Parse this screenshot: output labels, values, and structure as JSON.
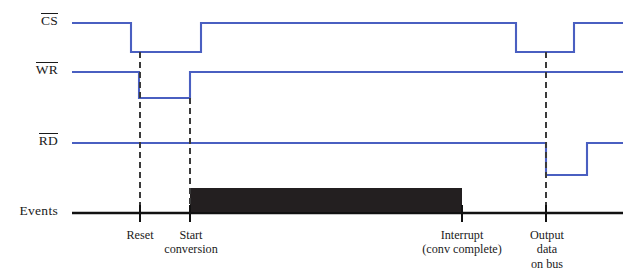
{
  "diagram": {
    "type": "timing-diagram",
    "width": 635,
    "height": 274,
    "colors": {
      "signal": "#4a5fc1",
      "event_line": "#111111",
      "dashed": "#3a3a3a",
      "conversion_bar": "#231f20",
      "background": "#ffffff"
    },
    "signals": [
      {
        "name": "CS",
        "label": "CS",
        "overbar": true,
        "active_low": true,
        "high_y": 23,
        "low_y": 52,
        "label_x": 58,
        "label_y": 23,
        "start_x": 72,
        "end_x": 623,
        "transitions": [
          {
            "x": 131,
            "edge": "falling"
          },
          {
            "x": 201,
            "edge": "rising"
          },
          {
            "x": 516,
            "edge": "falling"
          },
          {
            "x": 574,
            "edge": "rising"
          }
        ]
      },
      {
        "name": "WR",
        "label": "WR",
        "overbar": true,
        "active_low": true,
        "high_y": 72,
        "low_y": 98,
        "label_x": 58,
        "label_y": 72,
        "start_x": 72,
        "end_x": 623,
        "transitions": [
          {
            "x": 139,
            "edge": "falling"
          },
          {
            "x": 190,
            "edge": "rising"
          }
        ]
      },
      {
        "name": "RD",
        "label": "RD",
        "overbar": true,
        "active_low": true,
        "high_y": 143,
        "low_y": 175,
        "label_x": 58,
        "label_y": 143,
        "start_x": 72,
        "end_x": 623,
        "transitions": [
          {
            "x": 546,
            "edge": "falling"
          },
          {
            "x": 587,
            "edge": "rising"
          }
        ]
      },
      {
        "name": "Events",
        "label": "Events",
        "overbar": false,
        "active_low": false,
        "high_y": 213,
        "low_y": 213,
        "label_x": 58,
        "label_y": 213,
        "start_x": 72,
        "end_x": 623,
        "transitions": []
      }
    ],
    "conversion_bar": {
      "label": "conversion-busy",
      "x1": 190,
      "x2": 462,
      "y_top": 188,
      "y_bottom": 212
    },
    "dashed_markers": [
      {
        "x": 140,
        "y1": 52,
        "y2": 213
      },
      {
        "x": 190,
        "y1": 98,
        "y2": 213
      },
      {
        "x": 546,
        "y1": 52,
        "y2": 213
      }
    ],
    "event_ticks": [
      {
        "x": 140,
        "y1": 205,
        "y2": 222
      },
      {
        "x": 190,
        "y1": 205,
        "y2": 222
      },
      {
        "x": 462,
        "y1": 205,
        "y2": 222
      },
      {
        "x": 546,
        "y1": 205,
        "y2": 222
      }
    ],
    "event_labels": [
      {
        "x": 140,
        "y": 228,
        "lines": [
          "Reset"
        ]
      },
      {
        "x": 191,
        "y": 228,
        "lines": [
          "Start",
          "conversion"
        ]
      },
      {
        "x": 462,
        "y": 228,
        "lines": [
          "Interrupt",
          "(conv complete)"
        ]
      },
      {
        "x": 547,
        "y": 228,
        "lines": [
          "Output",
          "data",
          "on bus"
        ]
      }
    ]
  }
}
